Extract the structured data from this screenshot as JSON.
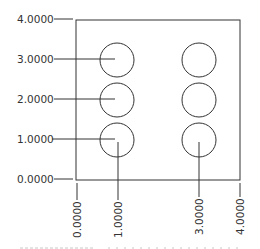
{
  "drawing": {
    "type": "ordinate-dimension-drawing",
    "plate": {
      "x_min": 0,
      "x_max": 4,
      "y_min": 0,
      "y_max": 4
    },
    "y_labels": [
      {
        "value": 4,
        "text": "4.0000"
      },
      {
        "value": 3,
        "text": "3.0000"
      },
      {
        "value": 2,
        "text": "2.0000"
      },
      {
        "value": 1,
        "text": "1.0000"
      },
      {
        "value": 0,
        "text": "0.0000"
      }
    ],
    "x_labels": [
      {
        "value": 0,
        "text": "0.0000"
      },
      {
        "value": 1,
        "text": "1.0000"
      },
      {
        "value": 3,
        "text": "3.0000"
      },
      {
        "value": 4,
        "text": "4.0000"
      }
    ],
    "holes": [
      {
        "x": 1,
        "y": 3
      },
      {
        "x": 1,
        "y": 2
      },
      {
        "x": 1,
        "y": 1
      },
      {
        "x": 3,
        "y": 3
      },
      {
        "x": 3,
        "y": 2
      },
      {
        "x": 3,
        "y": 1
      }
    ],
    "line_color": "#333333"
  }
}
